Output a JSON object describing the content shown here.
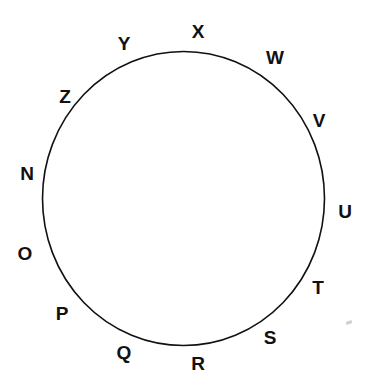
{
  "diagram": {
    "shape": "circle",
    "stroke_color": "#111111",
    "background": "#ffffff",
    "labels": [
      {
        "text": "X",
        "x": 198,
        "y": 31
      },
      {
        "text": "W",
        "x": 275,
        "y": 57
      },
      {
        "text": "V",
        "x": 319,
        "y": 120
      },
      {
        "text": "U",
        "x": 345,
        "y": 211
      },
      {
        "text": "T",
        "x": 318,
        "y": 287
      },
      {
        "text": "S",
        "x": 270,
        "y": 337
      },
      {
        "text": "R",
        "x": 198,
        "y": 363
      },
      {
        "text": "Q",
        "x": 124,
        "y": 352
      },
      {
        "text": "P",
        "x": 62,
        "y": 313
      },
      {
        "text": "O",
        "x": 25,
        "y": 253
      },
      {
        "text": "N",
        "x": 27,
        "y": 173
      },
      {
        "text": "Z",
        "x": 65,
        "y": 96
      },
      {
        "text": "Y",
        "x": 124,
        "y": 43
      }
    ]
  }
}
